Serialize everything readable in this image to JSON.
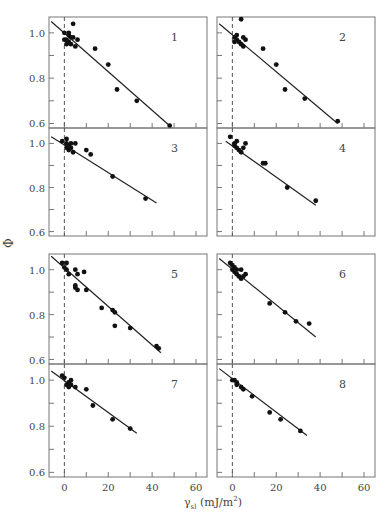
{
  "figure": {
    "y_axis_label": "Φ",
    "x_axis_symbol": "γ",
    "x_axis_subscript": "sl",
    "x_axis_unit_prefix": "(mJ/m",
    "x_axis_unit_sup": "2",
    "x_axis_unit_suffix": ")"
  },
  "chart_data": {
    "type": "scatter",
    "layout": "4x2 grid of panels with linear fits",
    "xlabel": "γsl (mJ/m²)",
    "ylabel": "Φ",
    "xlim": [
      -7,
      65
    ],
    "ylim": [
      0.58,
      1.07
    ],
    "x_ticks": [
      0,
      10,
      20,
      30,
      40,
      50,
      60
    ],
    "x_tick_labels": [
      "0",
      "20",
      "40",
      "60"
    ],
    "y_ticks": [
      0.6,
      0.7,
      0.8,
      0.9,
      1.0
    ],
    "y_tick_labels": [
      "0.6",
      "0.8",
      "1.0"
    ],
    "reference_line": {
      "x": 0,
      "style": "dashed"
    },
    "grid": false,
    "panels": [
      {
        "label": "1",
        "fit": [
          [
            -6,
            1.05
          ],
          [
            48,
            0.59
          ]
        ],
        "points": [
          [
            0,
            0.97
          ],
          [
            0,
            1.0
          ],
          [
            1,
            0.95
          ],
          [
            1,
            0.97
          ],
          [
            2,
            0.96
          ],
          [
            2,
            0.99
          ],
          [
            3,
            0.95
          ],
          [
            4,
            1.04
          ],
          [
            4,
            0.98
          ],
          [
            5,
            0.94
          ],
          [
            6,
            0.97
          ],
          [
            2,
            1.0
          ],
          [
            3,
            0.98
          ],
          [
            14,
            0.93
          ],
          [
            20,
            0.86
          ],
          [
            24,
            0.75
          ],
          [
            33,
            0.7
          ],
          [
            48,
            0.59
          ]
        ]
      },
      {
        "label": "2",
        "fit": [
          [
            -6,
            1.04
          ],
          [
            48,
            0.6
          ]
        ],
        "points": [
          [
            1,
            0.98
          ],
          [
            1,
            0.96
          ],
          [
            2,
            0.97
          ],
          [
            3,
            0.96
          ],
          [
            4,
            0.95
          ],
          [
            5,
            0.94
          ],
          [
            5,
            0.98
          ],
          [
            6,
            0.97
          ],
          [
            4,
            1.06
          ],
          [
            2,
            0.99
          ],
          [
            14,
            0.93
          ],
          [
            20,
            0.86
          ],
          [
            24,
            0.75
          ],
          [
            33,
            0.71
          ],
          [
            48,
            0.61
          ]
        ]
      },
      {
        "label": "3",
        "fit": [
          [
            -6,
            1.03
          ],
          [
            42,
            0.73
          ]
        ],
        "points": [
          [
            -1,
            1.01
          ],
          [
            1,
            1.02
          ],
          [
            1,
            0.98
          ],
          [
            1,
            1.0
          ],
          [
            2,
            0.99
          ],
          [
            2,
            0.97
          ],
          [
            3,
            0.98
          ],
          [
            3,
            1.0
          ],
          [
            4,
            0.96
          ],
          [
            5,
            1.0
          ],
          [
            10,
            0.97
          ],
          [
            12,
            0.95
          ],
          [
            22,
            0.85
          ],
          [
            37,
            0.75
          ]
        ]
      },
      {
        "label": "4",
        "fit": [
          [
            -3,
            1.01
          ],
          [
            38,
            0.72
          ]
        ],
        "points": [
          [
            -1,
            1.03
          ],
          [
            1,
            0.99
          ],
          [
            1,
            1.0
          ],
          [
            2,
            0.98
          ],
          [
            2,
            1.01
          ],
          [
            3,
            0.97
          ],
          [
            4,
            0.96
          ],
          [
            5,
            0.98
          ],
          [
            6,
            1.0
          ],
          [
            14,
            0.91
          ],
          [
            15,
            0.91
          ],
          [
            25,
            0.8
          ],
          [
            38,
            0.74
          ]
        ]
      },
      {
        "label": "5",
        "fit": [
          [
            -6,
            1.06
          ],
          [
            44,
            0.63
          ]
        ],
        "points": [
          [
            -1,
            1.03
          ],
          [
            0,
            1.01
          ],
          [
            1,
            1.03
          ],
          [
            1,
            1.0
          ],
          [
            2,
            0.98
          ],
          [
            5,
            1.0
          ],
          [
            5,
            0.93
          ],
          [
            5,
            0.92
          ],
          [
            6,
            0.91
          ],
          [
            6,
            0.98
          ],
          [
            9,
            0.99
          ],
          [
            10,
            0.91
          ],
          [
            17,
            0.83
          ],
          [
            22,
            0.82
          ],
          [
            23,
            0.81
          ],
          [
            23,
            0.75
          ],
          [
            30,
            0.74
          ],
          [
            42,
            0.66
          ],
          [
            43,
            0.65
          ]
        ]
      },
      {
        "label": "6",
        "fit": [
          [
            -6,
            1.05
          ],
          [
            38,
            0.7
          ]
        ],
        "points": [
          [
            -1,
            1.03
          ],
          [
            0,
            1.02
          ],
          [
            0,
            1.0
          ],
          [
            1,
            1.01
          ],
          [
            1,
            0.99
          ],
          [
            2,
            1.0
          ],
          [
            2,
            0.98
          ],
          [
            3,
            0.97
          ],
          [
            4,
            0.96
          ],
          [
            4,
            1.0
          ],
          [
            5,
            0.97
          ],
          [
            6,
            0.98
          ],
          [
            17,
            0.85
          ],
          [
            24,
            0.81
          ],
          [
            29,
            0.77
          ],
          [
            35,
            0.76
          ]
        ]
      },
      {
        "label": "7",
        "fit": [
          [
            -6,
            1.04
          ],
          [
            33,
            0.77
          ]
        ],
        "points": [
          [
            -1,
            1.02
          ],
          [
            0,
            1.01
          ],
          [
            1,
            0.98
          ],
          [
            2,
            0.99
          ],
          [
            2,
            0.97
          ],
          [
            3,
            1.0
          ],
          [
            3,
            0.98
          ],
          [
            5,
            0.97
          ],
          [
            10,
            0.96
          ],
          [
            13,
            0.89
          ],
          [
            22,
            0.83
          ],
          [
            30,
            0.79
          ]
        ]
      },
      {
        "label": "8",
        "fit": [
          [
            -6,
            1.05
          ],
          [
            34,
            0.76
          ]
        ],
        "points": [
          [
            0,
            1.0
          ],
          [
            1,
            1.0
          ],
          [
            2,
            0.99
          ],
          [
            2,
            0.98
          ],
          [
            4,
            0.97
          ],
          [
            5,
            0.96
          ],
          [
            9,
            0.93
          ],
          [
            17,
            0.86
          ],
          [
            22,
            0.83
          ],
          [
            31,
            0.78
          ]
        ]
      }
    ]
  },
  "colors": {
    "axis": "#777777",
    "point": "#111111",
    "fit_line": "#222222",
    "dashed": "#555555",
    "text": "#444444"
  }
}
